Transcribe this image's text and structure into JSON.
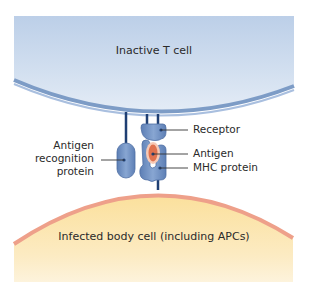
{
  "diagram": {
    "top_cell": {
      "label": "Inactive T cell",
      "fill": "#c9d8ec",
      "membrane": "#7d9cc6"
    },
    "bottom_cell": {
      "label": "Infected body cell (including APCs)",
      "fill": "#fbe3a8",
      "membrane": "#eea08a"
    },
    "labels": {
      "receptor": "Receptor",
      "antigen": "Antigen",
      "mhc": "MHC protein",
      "recognition_line1": "Antigen",
      "recognition_line2": "recognition",
      "recognition_line3": "protein"
    },
    "colors": {
      "protein": "#6f8fc0",
      "protein_dark": "#3f5f93",
      "stalk": "#1f3f73",
      "antigen_fill": "#e0724f",
      "antigen_ring": "#f7c9b5",
      "leader": "#333333"
    }
  }
}
